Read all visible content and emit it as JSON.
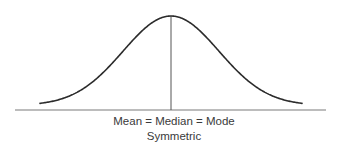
{
  "chart_data": {
    "type": "line",
    "title": "",
    "subtitle": "Symmetric",
    "xlabel": "Mean = Median = Mode",
    "ylabel": "",
    "grid": false,
    "legend": null,
    "x_ticks": [],
    "y_ticks": [],
    "distribution": {
      "shape": "normal",
      "symmetric": true,
      "center_marker": "vertical line at peak"
    },
    "series": [
      {
        "name": "density",
        "x": [
          -3,
          -2.5,
          -2,
          -1.5,
          -1,
          -0.5,
          0,
          0.5,
          1,
          1.5,
          2,
          2.5,
          3
        ],
        "values": [
          0.011,
          0.044,
          0.135,
          0.325,
          0.607,
          0.882,
          1.0,
          0.882,
          0.607,
          0.325,
          0.135,
          0.044,
          0.011
        ]
      }
    ]
  },
  "diagram": {
    "labels": {
      "main": "Mean = Median = Mode",
      "sub": "Symmetric"
    },
    "colors": {
      "curve": "#2b2b2b",
      "axis": "#7a7a7a",
      "center_line": "#555555",
      "text": "#3a3a3a",
      "background": "#ffffff"
    },
    "geometry": {
      "axis": {
        "x1": 15,
        "x2": 326,
        "y": 110
      },
      "curve": {
        "x_start": 40,
        "x_end": 302,
        "center_x": 171,
        "peak_y": 16,
        "base_y": 105.5,
        "sigma_px": 48
      },
      "center_line": {
        "x": 171,
        "y1": 16,
        "y2": 110
      }
    }
  }
}
